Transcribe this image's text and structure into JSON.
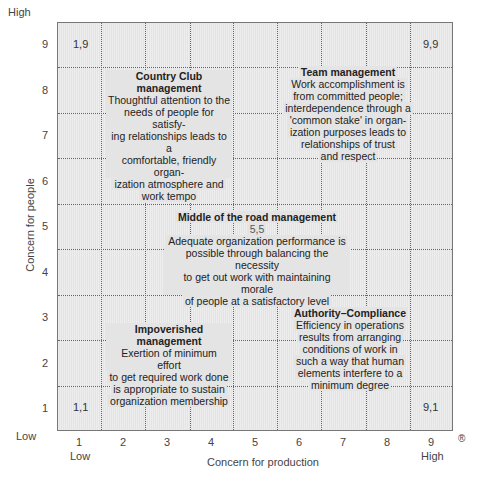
{
  "diagram": {
    "type": "managerial-grid",
    "x_axis": {
      "label": "Concern for production",
      "ticks": [
        "1",
        "2",
        "3",
        "4",
        "5",
        "6",
        "7",
        "8",
        "9"
      ],
      "low_label": "Low",
      "high_label": "High"
    },
    "y_axis": {
      "label": "Concern for people",
      "ticks": [
        "1",
        "2",
        "3",
        "4",
        "5",
        "6",
        "7",
        "8",
        "9"
      ],
      "low_label": "Low",
      "high_label": "High"
    },
    "registered_mark": "®",
    "corners": {
      "top_left": "1,9",
      "top_right": "9,9",
      "bottom_left": "1,1",
      "bottom_right": "9,1"
    },
    "styles": [
      {
        "title": "Country Club management",
        "lines": [
          "Thoughtful attention to the",
          "needs of people for satisfy-",
          "ing relationships leads to a",
          "comfortable, friendly organ-",
          "ization atmosphere and",
          "work tempo"
        ]
      },
      {
        "title": "Team management",
        "lines": [
          "Work accomplishment is",
          "from committed people;",
          "interdependence through a",
          "'common stake' in organ-",
          "ization purposes leads to",
          "relationships of trust",
          "and respect"
        ]
      },
      {
        "title": "Middle of the road management",
        "coord": "5,5",
        "lines": [
          "Adequate organization performance is",
          "possible through balancing the necessity",
          "to get out work with maintaining morale",
          "of people at a satisfactory level"
        ]
      },
      {
        "title": "Impoverished management",
        "lines": [
          "Exertion of minimum effort",
          "to get required work done",
          "is appropriate to sustain",
          "organization membership"
        ]
      },
      {
        "title": "Authority–Compliance",
        "lines": [
          "Efficiency in operations",
          "results from arranging",
          "conditions of work in",
          "such a way that human",
          "elements interfere to a",
          "minimum degree"
        ]
      }
    ]
  }
}
